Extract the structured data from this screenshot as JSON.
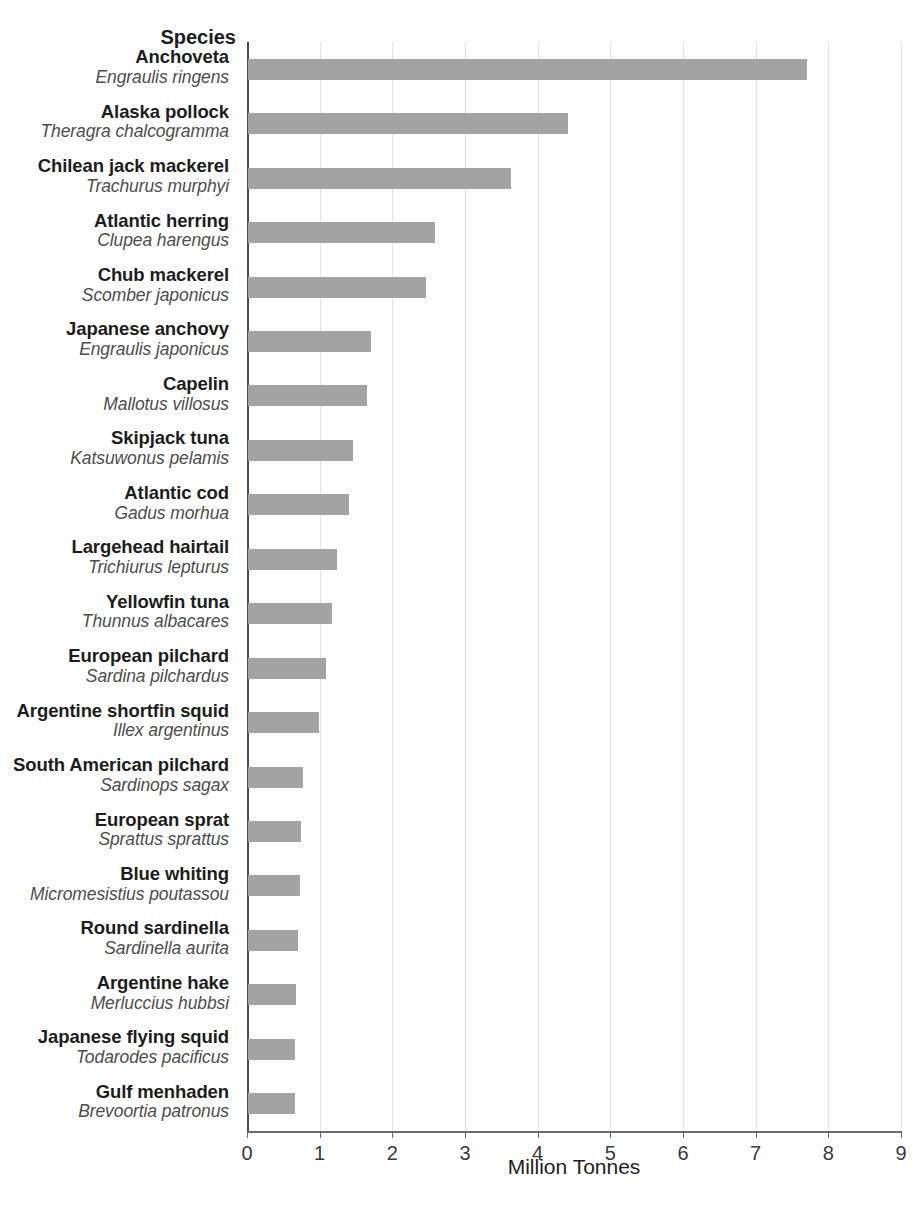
{
  "species_header": "Species",
  "axis": {
    "x_title": "Million Tonnes",
    "ticks": [
      "0",
      "1",
      "2",
      "3",
      "4",
      "5",
      "6",
      "7",
      "8",
      "9"
    ]
  },
  "style": {
    "bar_color": "#a3a3a3",
    "gridline_color": "#e2e2e2",
    "axis_color": "#4a4a4a",
    "label_color": "#1d1d1d",
    "sci_name_color": "#4d4d4d",
    "background": "#ffffff"
  },
  "chart_data": {
    "type": "bar",
    "orientation": "horizontal",
    "title": "",
    "subtitle": "",
    "xlabel": "Million Tonnes",
    "ylabel": "Species",
    "xlim": [
      0,
      9
    ],
    "xticks": [
      0,
      1,
      2,
      3,
      4,
      5,
      6,
      7,
      8,
      9
    ],
    "grid": "vertical",
    "legend": "none",
    "categories": [
      "Anchoveta",
      "Alaska pollock",
      "Chilean jack mackerel",
      "Atlantic herring",
      "Chub mackerel",
      "Japanese anchovy",
      "Capelin",
      "Skipjack tuna",
      "Atlantic cod",
      "Largehead hairtail",
      "Yellowfin tuna",
      "European pilchard",
      "Argentine shortfin squid",
      "South American pilchard",
      "European sprat",
      "Blue whiting",
      "Round sardinella",
      "Argentine hake",
      "Japanese flying squid",
      "Gulf menhaden"
    ],
    "scientific_names": [
      "Engraulis ringens",
      "Theragra chalcogramma",
      "Trachurus murphyi",
      "Clupea harengus",
      "Scomber japonicus",
      "Engraulis japonicus",
      "Mallotus villosus",
      "Katsuwonus pelamis",
      "Gadus morhua",
      "Trichiurus lepturus",
      "Thunnus albacares",
      "Sardina pilchardus",
      "Illex argentinus",
      "Sardinops sagax",
      "Sprattus sprattus",
      "Micromesistius poutassou",
      "Sardinella aurita",
      "Merluccius hubbsi",
      "Todarodes pacificus",
      "Brevoortia patronus"
    ],
    "values": [
      7.69,
      4.4,
      3.62,
      2.57,
      2.45,
      1.69,
      1.64,
      1.44,
      1.39,
      1.22,
      1.16,
      1.07,
      0.98,
      0.76,
      0.73,
      0.72,
      0.69,
      0.66,
      0.65,
      0.64
    ],
    "units": "Million Tonnes"
  }
}
